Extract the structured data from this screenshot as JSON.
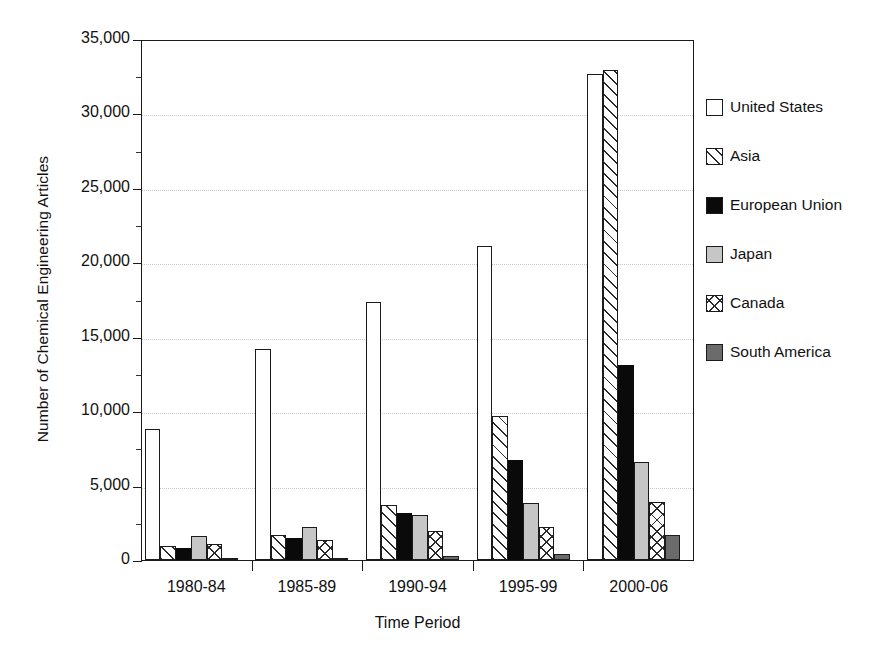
{
  "chart_data": {
    "type": "bar",
    "title": "",
    "xlabel": "Time Period",
    "ylabel": "Number of Chemical Engineering Articles",
    "categories": [
      "1980-84",
      "1985-89",
      "1990-94",
      "1995-99",
      "2000-06"
    ],
    "ylim": [
      0,
      35000
    ],
    "yticks": [
      0,
      5000,
      10000,
      15000,
      20000,
      25000,
      30000,
      35000
    ],
    "ytick_labels": [
      "0",
      "5,000",
      "10,000",
      "15,000",
      "20,000",
      "25,000",
      "30,000",
      "35,000"
    ],
    "grid": "horizontal-dotted",
    "legend_position": "right",
    "series": [
      {
        "name": "United States",
        "key": "united-states",
        "fill": "white-open",
        "values": [
          8800,
          14200,
          17350,
          21100,
          32650
        ]
      },
      {
        "name": "Asia",
        "key": "asia",
        "fill": "diagonal-hatch",
        "values": [
          950,
          1650,
          3700,
          9650,
          32900
        ]
      },
      {
        "name": "European Union",
        "key": "european-union",
        "fill": "solid-black",
        "values": [
          800,
          1450,
          3150,
          6750,
          13100
        ]
      },
      {
        "name": "Japan",
        "key": "japan",
        "fill": "light-gray",
        "values": [
          1600,
          2250,
          3000,
          3800,
          6600
        ]
      },
      {
        "name": "Canada",
        "key": "canada",
        "fill": "cross-hatch",
        "values": [
          1050,
          1350,
          1950,
          2250,
          3900
        ]
      },
      {
        "name": "South America",
        "key": "south-america",
        "fill": "dark-gray",
        "values": [
          120,
          130,
          250,
          430,
          1650
        ]
      }
    ]
  },
  "colors": {
    "axis": "#1b1b1b",
    "grid": "#c9c9c9",
    "black_fill": "#0a0a0a",
    "light_gray_fill": "#c6c6c6",
    "dark_gray_fill": "#6b6b6b",
    "background": "#ffffff"
  }
}
